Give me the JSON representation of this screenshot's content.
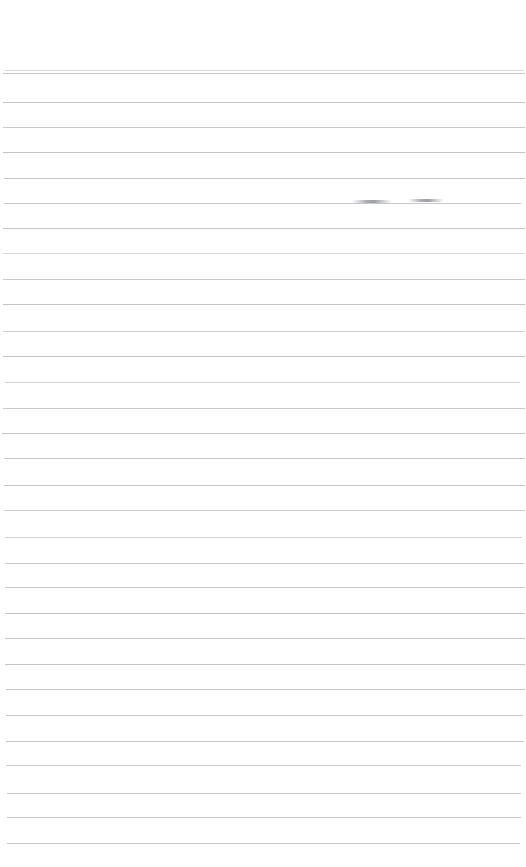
{
  "document": {
    "kind": "blank-ruled-notebook-page",
    "title": "Blank Ruled Page",
    "page_width": 526,
    "page_height": 867,
    "background_color": "#ffffff",
    "rule_color": "#b9bcc0",
    "smudge_color": "#6c7076",
    "has_text": false,
    "body_text": "",
    "header_text": "",
    "footer_text": "",
    "page_number_text": ""
  },
  "layout": {
    "top_margin_height": 70,
    "left_inset": 3,
    "right_edge": 521,
    "rule_count": 30,
    "average_rule_spacing": 25.4,
    "rule_thickness": 1
  },
  "rules": [
    {
      "y": 70,
      "x1": 5,
      "x2": 524,
      "opacity": 0.55
    },
    {
      "y": 73,
      "x1": 3,
      "x2": 525,
      "opacity": 0.8
    },
    {
      "y": 102,
      "x1": 3,
      "x2": 525,
      "opacity": 0.88
    },
    {
      "y": 127,
      "x1": 3,
      "x2": 525,
      "opacity": 0.82
    },
    {
      "y": 152,
      "x1": 3,
      "x2": 525,
      "opacity": 0.88
    },
    {
      "y": 178,
      "x1": 4,
      "x2": 525,
      "opacity": 0.86
    },
    {
      "y": 203,
      "x1": 4,
      "x2": 521,
      "opacity": 0.8
    },
    {
      "y": 228,
      "x1": 3,
      "x2": 525,
      "opacity": 0.86
    },
    {
      "y": 253,
      "x1": 3,
      "x2": 525,
      "opacity": 0.6
    },
    {
      "y": 279,
      "x1": 3,
      "x2": 525,
      "opacity": 0.82
    },
    {
      "y": 304,
      "x1": 3,
      "x2": 525,
      "opacity": 0.88
    },
    {
      "y": 331,
      "x1": 3,
      "x2": 525,
      "opacity": 0.72
    },
    {
      "y": 356,
      "x1": 3,
      "x2": 525,
      "opacity": 0.88
    },
    {
      "y": 382,
      "x1": 5,
      "x2": 520,
      "opacity": 0.7
    },
    {
      "y": 408,
      "x1": 3,
      "x2": 525,
      "opacity": 0.82
    },
    {
      "y": 433,
      "x1": 2,
      "x2": 525,
      "opacity": 0.86
    },
    {
      "y": 458,
      "x1": 4,
      "x2": 525,
      "opacity": 0.84
    },
    {
      "y": 485,
      "x1": 4,
      "x2": 525,
      "opacity": 0.86
    },
    {
      "y": 510,
      "x1": 4,
      "x2": 525,
      "opacity": 0.72
    },
    {
      "y": 537,
      "x1": 5,
      "x2": 522,
      "opacity": 0.7
    },
    {
      "y": 563,
      "x1": 5,
      "x2": 524,
      "opacity": 0.78
    },
    {
      "y": 587,
      "x1": 5,
      "x2": 525,
      "opacity": 0.8
    },
    {
      "y": 613,
      "x1": 5,
      "x2": 525,
      "opacity": 0.88
    },
    {
      "y": 638,
      "x1": 5,
      "x2": 525,
      "opacity": 0.82
    },
    {
      "y": 664,
      "x1": 5,
      "x2": 525,
      "opacity": 0.86
    },
    {
      "y": 689,
      "x1": 6,
      "x2": 525,
      "opacity": 0.86
    },
    {
      "y": 715,
      "x1": 6,
      "x2": 523,
      "opacity": 0.82
    },
    {
      "y": 741,
      "x1": 6,
      "x2": 524,
      "opacity": 0.8
    },
    {
      "y": 765,
      "x1": 6,
      "x2": 521,
      "opacity": 0.72
    },
    {
      "y": 793,
      "x1": 7,
      "x2": 521,
      "opacity": 0.8
    },
    {
      "y": 817,
      "x1": 7,
      "x2": 521,
      "opacity": 0.82
    },
    {
      "y": 843,
      "x1": 7,
      "x2": 520,
      "opacity": 0.78
    }
  ],
  "marks": [
    {
      "label": "ink-smudge-left",
      "x": 352,
      "y": 200,
      "width": 40,
      "height": 3
    },
    {
      "label": "ink-smudge-right",
      "x": 408,
      "y": 199,
      "width": 36,
      "height": 3
    }
  ]
}
